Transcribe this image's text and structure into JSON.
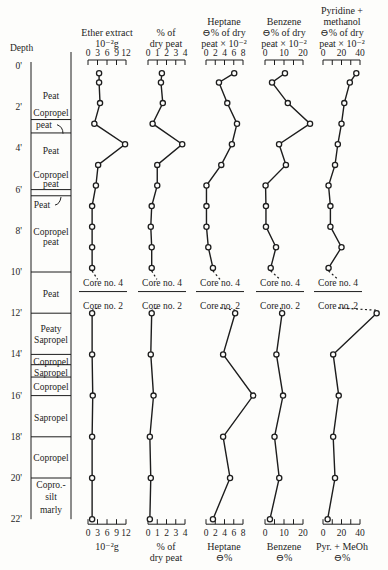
{
  "chart_data": {
    "type": "line",
    "title": "",
    "orientation": "vertical-depth-profile",
    "depth_axis": {
      "label": "Depth",
      "unit": "ft",
      "ticks": [
        "0'",
        "2'",
        "4'",
        "6'",
        "8'",
        "10'",
        "12'",
        "14'",
        "16'",
        "18'",
        "20'",
        "22'"
      ],
      "range": [
        0,
        22
      ]
    },
    "stratigraphy": [
      {
        "label": "Peat",
        "top": 0,
        "bottom": 2.6
      },
      {
        "label": "Copropel peat",
        "top": 2.6,
        "bottom": 3.25
      },
      {
        "label": "Peat",
        "top": 3.25,
        "bottom": 5.2
      },
      {
        "label": "Copropel peat",
        "top": 5.2,
        "bottom": 6.0
      },
      {
        "label": "Peat",
        "top": 6.0,
        "bottom": 6.3
      },
      {
        "label": "Copropel peat",
        "top": 6.3,
        "bottom": 10.0
      },
      {
        "label": "Peat",
        "top": 10.0,
        "bottom": 12.0
      },
      {
        "label": "Peaty Sapropel",
        "top": 12.0,
        "bottom": 14.0
      },
      {
        "label": "Copropel",
        "top": 14.0,
        "bottom": 14.5
      },
      {
        "label": "Sapropel",
        "top": 14.5,
        "bottom": 15.1
      },
      {
        "label": "Copropel",
        "top": 15.1,
        "bottom": 16.0
      },
      {
        "label": "Sapropel",
        "top": 16.0,
        "bottom": 18.0
      },
      {
        "label": "Copropel",
        "top": 18.0,
        "bottom": 20.0
      },
      {
        "label": "Copro.-silt marly",
        "top": 20.0,
        "bottom": 22.0
      }
    ],
    "core_break": {
      "depth": 10.9,
      "upper_label": "Core no. 4",
      "lower_label": "Core no. 2"
    },
    "depths_upper": [
      0.35,
      0.8,
      1.8,
      2.8,
      3.8,
      4.8,
      5.8,
      6.8,
      7.8,
      8.8,
      9.8
    ],
    "depths_lower": [
      12,
      14,
      16,
      18,
      20,
      22
    ],
    "series": [
      {
        "name": "Ether extract",
        "top_title": [
          "Ether extract",
          "10⁻²g"
        ],
        "bottom_title": [
          "10⁻²g"
        ],
        "xlim": [
          0,
          12
        ],
        "ticks": [
          "0",
          "3",
          "6",
          "9",
          "12"
        ],
        "values_upper": [
          3.5,
          3.5,
          3.8,
          2.0,
          11.7,
          3.2,
          2.5,
          1.3,
          1.3,
          1.3,
          1.3
        ],
        "values_lower": [
          1.3,
          1.3,
          1.5,
          1.3,
          1.3,
          1.3
        ]
      },
      {
        "name": "% of dry peat",
        "top_title": [
          "% of",
          "dry peat"
        ],
        "bottom_title": [
          "% of",
          "dry peat"
        ],
        "xlim": [
          0,
          4
        ],
        "ticks": [
          "0",
          "1",
          "2",
          "3",
          "4"
        ],
        "values_upper": [
          1.5,
          1.4,
          1.6,
          0.5,
          3.7,
          1.0,
          1.0,
          0.4,
          0.3,
          0.4,
          0.4
        ],
        "values_lower": [
          0.4,
          0.3,
          0.6,
          0.2,
          0.3,
          0.2
        ]
      },
      {
        "name": "Heptane",
        "top_title": [
          "Heptane",
          "⊖% of dry",
          "peat × 10⁻²"
        ],
        "bottom_title": [
          "Heptane",
          "⊖%"
        ],
        "xlim": [
          0,
          8
        ],
        "ticks": [
          "0",
          "2",
          "4",
          "6",
          "8"
        ],
        "values_upper": [
          6.1,
          2.8,
          4.6,
          6.7,
          5.6,
          3.3,
          0.1,
          0.1,
          0.1,
          0.5,
          1.5
        ],
        "values_lower": [
          6.3,
          3.7,
          10.2,
          3.7,
          5.2,
          1.5
        ]
      },
      {
        "name": "Benzene",
        "top_title": [
          "Benzene",
          "⊖% of dry",
          "peat × 10⁻²"
        ],
        "bottom_title": [
          "Benzene",
          "⊖%"
        ],
        "xlim": [
          0,
          20
        ],
        "ticks": [
          "0",
          "10",
          "20"
        ],
        "values_upper": [
          10.5,
          3.7,
          12.0,
          23.7,
          7.4,
          11.0,
          0.3,
          0.5,
          0.5,
          5.8,
          3.0
        ],
        "values_lower": [
          9.0,
          6.0,
          9.5,
          5.0,
          7.5,
          2.6
        ]
      },
      {
        "name": "Pyridine + methanol",
        "top_title": [
          "Pyridine +",
          "methanol",
          "⊖% of dry",
          "peat × 10⁻²"
        ],
        "bottom_title": [
          "Pyr. + MeOh",
          "⊖%"
        ],
        "xlim": [
          0,
          40
        ],
        "ticks": [
          "0",
          "20",
          "40"
        ],
        "values_upper": [
          36,
          29,
          23,
          20,
          16,
          13,
          6,
          8,
          8,
          20,
          6
        ],
        "values_lower": [
          58,
          11,
          17,
          11,
          13,
          5
        ]
      }
    ],
    "grid": false,
    "legend": "none"
  },
  "labels": {
    "depth_title": "Depth"
  }
}
